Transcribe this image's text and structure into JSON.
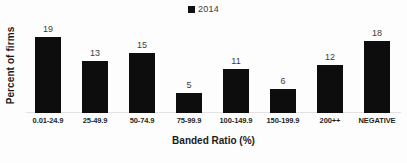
{
  "chart_data": {
    "type": "bar",
    "title": "",
    "subtitle": "",
    "xlabel": "Banded Ratio (%)",
    "ylabel": "Percent of firms",
    "categories": [
      "0.01-24.9",
      "25-49.9",
      "50-74.9",
      "75-99.9",
      "100-149.9",
      "150-199.9",
      "200++",
      "NEGATIVE"
    ],
    "series": [
      {
        "name": "2014",
        "values": [
          19,
          13,
          15,
          5,
          11,
          6,
          12,
          18
        ],
        "color": "#0d0d0d"
      }
    ],
    "data_labels": [
      "19",
      "13",
      "15",
      "5",
      "11",
      "6",
      "12",
      "18"
    ],
    "ylim": [
      0,
      19
    ],
    "grid": false,
    "y_axis_ticks_visible": false,
    "legend": {
      "position": "top-center",
      "entries": [
        {
          "label": "2014",
          "marker": "square-marker",
          "color": "#0d0d0d"
        }
      ]
    },
    "axis_line_color": "#e2e2e2",
    "background_color": "#fdfdfd"
  }
}
